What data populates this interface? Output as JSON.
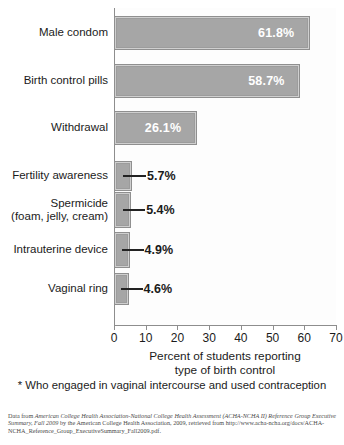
{
  "chart_data": {
    "type": "bar",
    "orientation": "horizontal",
    "title": "",
    "xlabel": "Percent of students reporting type of birth control",
    "ylabel": "",
    "xlim": [
      0,
      70
    ],
    "xticks": [
      0,
      10,
      20,
      30,
      40,
      50,
      60,
      70
    ],
    "grid": false,
    "legend": "none",
    "categories": [
      "Male condom",
      "Birth control pills",
      "Withdrawal",
      "Fertility awareness",
      "Spermicide (foam, jelly, cream)",
      "Intrauterine device",
      "Vaginal ring"
    ],
    "values": [
      61.8,
      58.7,
      26.1,
      5.7,
      5.4,
      4.9,
      4.6
    ],
    "value_labels": [
      "61.8%",
      "58.7%",
      "26.1%",
      "5.7%",
      "5.4%",
      "4.9%",
      "4.6%"
    ],
    "label_placement": [
      "inside",
      "inside",
      "inside",
      "outside",
      "outside",
      "outside",
      "outside"
    ],
    "bar_color": "#a6a6a6",
    "bar_edge_color": "#8f8f8f",
    "inside_label_color": "#ffffff",
    "outside_label_color": "#1b1b1b"
  },
  "axis": {
    "x_title_line1": "Percent of students reporting",
    "x_title_line2": "type of birth control",
    "tick_labels": [
      "0",
      "10",
      "20",
      "30",
      "40",
      "50",
      "60",
      "70"
    ]
  },
  "categories_display": [
    {
      "line1": "Male condom",
      "line2": ""
    },
    {
      "line1": "Birth control pills",
      "line2": ""
    },
    {
      "line1": "Withdrawal",
      "line2": ""
    },
    {
      "line1": "Fertility awareness",
      "line2": ""
    },
    {
      "line1": "Spermicide",
      "line2": "(foam, jelly, cream)"
    },
    {
      "line1": "Intrauterine device",
      "line2": ""
    },
    {
      "line1": "Vaginal ring",
      "line2": ""
    }
  ],
  "footnote": "* Who engaged in vaginal intercourse and used contraception",
  "source": {
    "prefix": "Data from ",
    "italic_title": "American College Health Association-National College Health Assessment (ACHA-NCHA II) Reference Group Executive Summary, Fall 2009",
    "suffix": " by the American College Health Association, 2009, retrieved from http://www.acha-ncha.org/docs/ACHA-NCHA_Reference_Group_ExecutiveSummary_Fall2009.pdf."
  }
}
